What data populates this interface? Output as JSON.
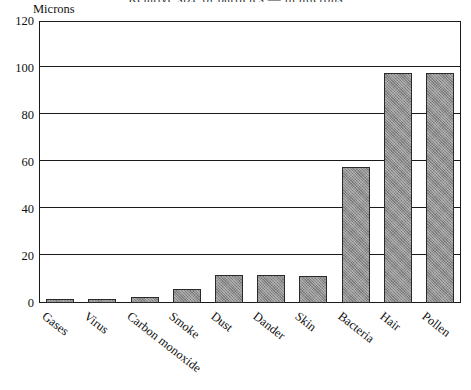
{
  "chart_data": {
    "type": "bar",
    "title": "Relative size of particles — in microns",
    "ylabel": "Microns",
    "xlabel": "",
    "categories": [
      "Gases",
      "Virus",
      "Carbon monoxide",
      "Smoke",
      "Dust",
      "Dander",
      "Skin",
      "Bacteria",
      "Hair",
      "Pollen"
    ],
    "values": [
      1,
      1,
      2.5,
      6,
      12,
      12,
      11.5,
      58,
      98,
      98
    ],
    "ylim": [
      0,
      120
    ],
    "yticks": [
      0,
      20,
      40,
      60,
      80,
      100,
      120
    ],
    "ytick_labels": [
      "0",
      "20",
      "40",
      "60",
      "80",
      "100",
      "120"
    ],
    "grid": "horizontal",
    "legend": "none",
    "bar_color": "#8e8e8e",
    "bar_edge_color": "#2a2a2a",
    "axis_color": "#1a1a1a",
    "background": "#ffffff"
  }
}
